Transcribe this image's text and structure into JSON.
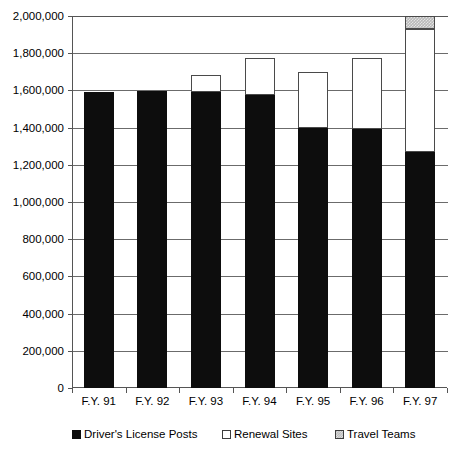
{
  "chart_data": {
    "type": "bar",
    "subtype": "stacked-bar",
    "title": "",
    "xlabel": "",
    "ylabel": "",
    "categories": [
      "F.Y. 91",
      "F.Y. 92",
      "F.Y. 93",
      "F.Y. 94",
      "F.Y. 95",
      "F.Y. 96",
      "F.Y. 97"
    ],
    "series": [
      {
        "name": "Driver's License Posts",
        "color": "#0d0d0d",
        "values": [
          1590000,
          1595000,
          1590000,
          1575000,
          1400000,
          1395000,
          1270000
        ]
      },
      {
        "name": "Renewal Sites",
        "color": "#ffffff",
        "values": [
          0,
          0,
          95000,
          200000,
          300000,
          380000,
          660000
        ]
      },
      {
        "name": "Travel Teams",
        "color": "#b9b9b9",
        "values": [
          0,
          0,
          0,
          0,
          0,
          0,
          70000
        ]
      }
    ],
    "totals": [
      1590000,
      1595000,
      1685000,
      1775000,
      1700000,
      1775000,
      2000000
    ],
    "ylim": [
      0,
      2000000
    ],
    "ytick_step": 200000,
    "ytick_labels": [
      "2,000,000",
      "1,800,000",
      "1,600,000",
      "1,400,000",
      "1,200,000",
      "1,000,000",
      "800,000",
      "600,000",
      "400,000",
      "200,000",
      "0"
    ],
    "ytick_values": [
      2000000,
      1800000,
      1600000,
      1400000,
      1200000,
      1000000,
      800000,
      600000,
      400000,
      200000,
      0
    ],
    "grid": true,
    "grid_axis": "y",
    "legend_position": "bottom"
  },
  "legend": {
    "items": [
      {
        "label": "Driver's License Posts",
        "swatch": "swatch-posts"
      },
      {
        "label": "Renewal Sites",
        "swatch": "swatch-renewal"
      },
      {
        "label": "Travel Teams",
        "swatch": "swatch-travel"
      }
    ]
  }
}
